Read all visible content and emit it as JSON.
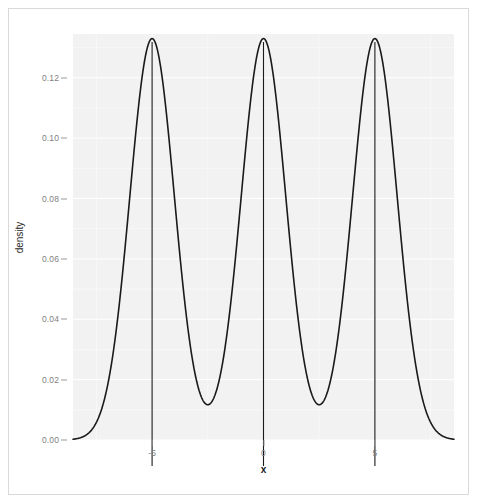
{
  "chart_data": {
    "type": "line",
    "title": "",
    "subtitle": "",
    "xlabel": "x",
    "ylabel": "density",
    "xlim": [
      -8.55,
      8.55
    ],
    "ylim": [
      0.0,
      0.1345
    ],
    "grid": true,
    "legend": null,
    "x_ticks": [
      {
        "value": -5,
        "label": "-5"
      },
      {
        "value": 0,
        "label": "0"
      },
      {
        "value": 5,
        "label": "5"
      }
    ],
    "y_ticks": [
      {
        "value": 0.0,
        "label": "0.00"
      },
      {
        "value": 0.02,
        "label": "0.02"
      },
      {
        "value": 0.04,
        "label": "0.04"
      },
      {
        "value": 0.06,
        "label": "0.06"
      },
      {
        "value": 0.08,
        "label": "0.08"
      },
      {
        "value": 0.1,
        "label": "0.10"
      },
      {
        "value": 0.12,
        "label": "0.12"
      }
    ],
    "series": [
      {
        "name": "density",
        "kind": "density-curve",
        "color": "#1a1a1a",
        "line_width": 1.6,
        "description": "Trimodal Gaussian mixture density: equal-weight components centred at -5, 0 and 5.",
        "mixture": {
          "weights": [
            0.3333333,
            0.3333333,
            0.3333333
          ],
          "means": [
            -5,
            0,
            5
          ],
          "sds": [
            1.0,
            1.0,
            1.0
          ]
        },
        "peaks": [
          {
            "x": -5,
            "y": 0.127
          },
          {
            "x": 0,
            "y": 0.127
          },
          {
            "x": 5,
            "y": 0.127
          }
        ],
        "valleys": [
          {
            "x": -2.5,
            "y": 0.0156
          },
          {
            "x": 2.5,
            "y": 0.0156
          }
        ]
      }
    ],
    "reference_lines": [
      {
        "orientation": "vertical",
        "x": -5,
        "color": "#1a1a1a",
        "width": 1.1
      },
      {
        "orientation": "vertical",
        "x": 0,
        "color": "#1a1a1a",
        "width": 1.1
      },
      {
        "orientation": "vertical",
        "x": 5,
        "color": "#1a1a1a",
        "width": 1.1
      }
    ],
    "colors": {
      "panel_background": "#f2f2f2",
      "grid_major": "#ffffff",
      "grid_minor": "#fafafa",
      "curve": "#1a1a1a",
      "axis_text": "#7f7f7f",
      "axis_title": "#1a1a1a",
      "figure_border": "#d9d9d9",
      "figure_background": "#ffffff"
    }
  }
}
